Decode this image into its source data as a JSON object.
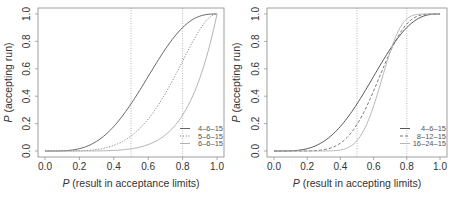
{
  "chart_data": [
    {
      "type": "line",
      "panel": "left",
      "xlabel_italic": "P",
      "xlabel_rest": " (result in acceptance limits)",
      "ylabel_italic": "P",
      "ylabel_rest": " (accepting run)",
      "xlim": [
        0,
        1
      ],
      "ylim": [
        0,
        1
      ],
      "xticks": [
        "0.0",
        "0.2",
        "0.4",
        "0.6",
        "0.8",
        "1.0"
      ],
      "yticks": [
        "0.0",
        "0.2",
        "0.4",
        "0.6",
        "0.8",
        "1.0"
      ],
      "vlines": [
        0.5,
        0.8
      ],
      "legend_position": "bottom-right",
      "series": [
        {
          "name": "4–6–15",
          "k": 4,
          "n": 6,
          "style": "solid",
          "color": "#555555",
          "sample": {
            "x": [
              0.0,
              0.2,
              0.4,
              0.5,
              0.6,
              0.8,
              1.0
            ],
            "y": [
              0.0,
              0.017,
              0.179,
              0.344,
              0.544,
              0.901,
              1.0
            ]
          }
        },
        {
          "name": "5–6–15",
          "k": 5,
          "n": 6,
          "style": "dotted",
          "color": "#777777",
          "sample": {
            "x": [
              0.0,
              0.2,
              0.4,
              0.5,
              0.6,
              0.8,
              1.0
            ],
            "y": [
              0.0,
              0.002,
              0.041,
              0.109,
              0.233,
              0.655,
              1.0
            ]
          }
        },
        {
          "name": "6–6–15",
          "k": 6,
          "n": 6,
          "style": "solid",
          "color": "#aaaaaa",
          "sample": {
            "x": [
              0.0,
              0.2,
              0.4,
              0.5,
              0.6,
              0.8,
              1.0
            ],
            "y": [
              0.0,
              0.0001,
              0.004,
              0.016,
              0.047,
              0.262,
              1.0
            ]
          }
        }
      ]
    },
    {
      "type": "line",
      "panel": "right",
      "xlabel_italic": "P",
      "xlabel_rest": " (result in accepting limits)",
      "ylabel_italic": "P",
      "ylabel_rest": " (accepting run)",
      "xlim": [
        0,
        1
      ],
      "ylim": [
        0,
        1
      ],
      "xticks": [
        "0.0",
        "0.2",
        "0.4",
        "0.6",
        "0.8",
        "1.0"
      ],
      "yticks": [
        "0.0",
        "0.2",
        "0.4",
        "0.6",
        "0.8",
        "1.0"
      ],
      "vlines": [
        0.5,
        0.8
      ],
      "legend_position": "bottom-right",
      "series": [
        {
          "name": "4–6–15",
          "k": 4,
          "n": 6,
          "style": "solid",
          "color": "#444444",
          "sample": {
            "x": [
              0.0,
              0.2,
              0.4,
              0.5,
              0.6,
              0.8,
              1.0
            ],
            "y": [
              0.0,
              0.017,
              0.179,
              0.344,
              0.544,
              0.901,
              1.0
            ]
          }
        },
        {
          "name": "8–12–15",
          "k": 8,
          "n": 12,
          "style": "dashed",
          "color": "#666666",
          "sample": {
            "x": [
              0.0,
              0.2,
              0.4,
              0.5,
              0.6,
              0.8,
              1.0
            ],
            "y": [
              0.0,
              0.001,
              0.057,
              0.194,
              0.438,
              0.927,
              1.0
            ]
          }
        },
        {
          "name": "16–24–15",
          "k": 16,
          "n": 24,
          "style": "solid",
          "color": "#b0b0b0",
          "sample": {
            "x": [
              0.0,
              0.2,
              0.4,
              0.5,
              0.6,
              0.8,
              1.0
            ],
            "y": [
              0.0,
              0.0,
              0.008,
              0.076,
              0.328,
              0.964,
              1.0
            ]
          }
        }
      ]
    }
  ]
}
